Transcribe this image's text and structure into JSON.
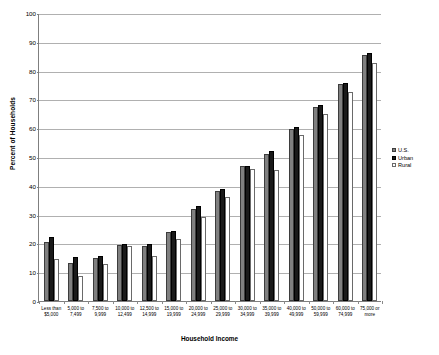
{
  "chart_data": {
    "type": "bar",
    "title": "",
    "xlabel": "Household Income",
    "ylabel": "Percent of Households",
    "ylim": [
      0,
      100
    ],
    "ytick_step": 10,
    "yticks": [
      0,
      10,
      20,
      30,
      40,
      50,
      60,
      70,
      80,
      90,
      100
    ],
    "grid": true,
    "legend_position": "right",
    "categories": [
      "Less than\n$5,000",
      "5,000 to\n7,499",
      "7,500 to\n9,999",
      "10,000 to\n12,499",
      "12,500 to\n14,999",
      "15,000 to\n19,999",
      "20,000 to\n24,999",
      "25,000 to\n29,999",
      "30,000 to\n34,999",
      "35,000 to\n39,999",
      "40,000 to\n49,999",
      "50,000 to\n59,999",
      "60,000 to\n74,999",
      "75,000 or\nmore"
    ],
    "series": [
      {
        "name": "U.S.",
        "color": "#808080",
        "values": [
          20.5,
          13.3,
          15.1,
          19.6,
          19.1,
          23.8,
          32.1,
          38.3,
          46.8,
          51.2,
          59.7,
          67.3,
          75.2,
          85.4
        ]
      },
      {
        "name": "Urban",
        "color": "#1a1a1a",
        "values": [
          22.3,
          15.3,
          15.8,
          19.9,
          19.9,
          24.4,
          33.0,
          39.0,
          47.0,
          52.0,
          60.3,
          68.0,
          75.8,
          86.2
        ]
      },
      {
        "name": "Rural",
        "color": "#ffffff",
        "values": [
          14.5,
          8.8,
          13.0,
          19.0,
          15.6,
          21.6,
          29.3,
          36.0,
          45.8,
          45.5,
          57.5,
          64.8,
          72.6,
          82.6
        ]
      }
    ]
  },
  "legend": {
    "items": [
      {
        "label": "U.S."
      },
      {
        "label": "Urban"
      },
      {
        "label": "Rural"
      }
    ]
  }
}
